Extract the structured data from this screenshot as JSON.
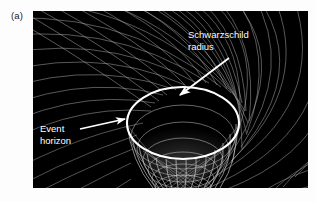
{
  "figure": {
    "panel_label": "(a)",
    "background_color": "#ffffff",
    "panel_background_color": "#000000",
    "mesh_color": "#c8c8c8",
    "highlight_color": "#ffffff",
    "annotations": [
      {
        "name": "schwarzschild-radius",
        "line1": "Schwarzschild",
        "line2": "radius",
        "leader": {
          "from_x": 196,
          "from_y": 47,
          "to_x": 147,
          "to_y": 84,
          "arrowhead": "end"
        }
      },
      {
        "name": "event-horizon",
        "line1": "Event",
        "line2": "horizon",
        "leader": {
          "from_x": 47,
          "from_y": 118,
          "to_x": 92,
          "to_y": 108,
          "arrowhead": "end"
        }
      }
    ],
    "geometry": {
      "description": "warped spacetime grid funnel with black hole throat",
      "ellipse_center_x": 150,
      "ellipse_center_y": 112,
      "ellipse_radius_x": 56,
      "ellipse_radius_y": 36,
      "funnel_bottom_y": 177,
      "funnel_half_width": 30,
      "grid_rows": 13,
      "grid_cols": 13
    }
  }
}
